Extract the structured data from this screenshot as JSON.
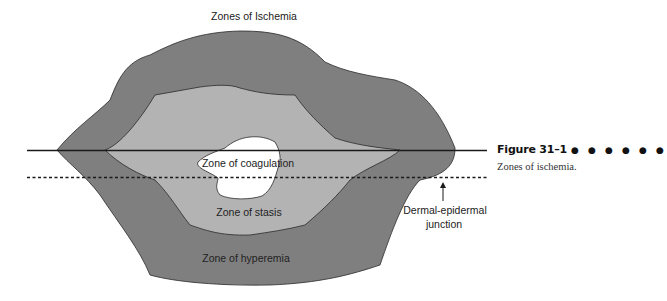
{
  "figure": {
    "title": "Zones of Ischemia",
    "number_label": "Figure 31–1",
    "number_decoration": "● ● ● ● ● ●",
    "caption": "Zones of ischemia."
  },
  "labels": {
    "coagulation": "Zone of coagulation",
    "stasis": "Zone of stasis",
    "hyperemia": "Zone of hyperemia",
    "junction_line1": "Dermal-epidermal",
    "junction_line2": "junction"
  },
  "colors": {
    "hyperemia": "#7f7f7f",
    "stasis": "#b3b3b3",
    "coagulation": "#ffffff",
    "outline": "#2a2a2a"
  }
}
